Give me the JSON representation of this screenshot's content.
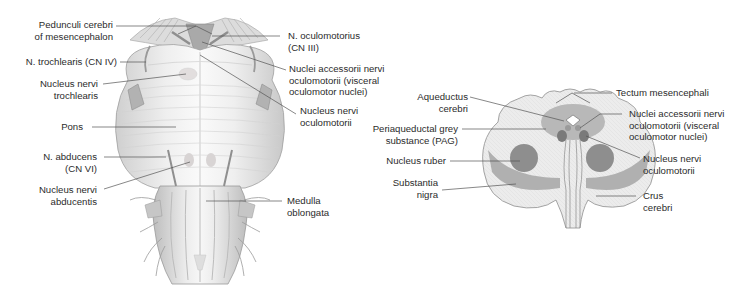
{
  "figure_left": {
    "title": "Brainstem, ventral view",
    "labels": {
      "pedunculi": [
        "Pedunculi cerebri",
        "of mesencephalon"
      ],
      "trochlearis": [
        "N. trochlearis (CN IV)"
      ],
      "nucleus_trochlearis": [
        "Nucleus nervi",
        "trochlearis"
      ],
      "pons": [
        "Pons"
      ],
      "abducens": [
        "N. abducens",
        "(CN VI)"
      ],
      "nucleus_abducentis": [
        "Nucleus nervi",
        "abducentis"
      ],
      "oculomotorius": [
        "N. oculomotorius",
        "(CN III)"
      ],
      "nuclei_accessorii": [
        "Nuclei accessorii nervi",
        "oculomotorii (visceral",
        "oculomotor nuclei)"
      ],
      "nucleus_oculomotorii": [
        "Nucleus nervi",
        "oculomotorii"
      ],
      "medulla": [
        "Medulla",
        "oblongata"
      ]
    }
  },
  "figure_right": {
    "title": "Midbrain cross-section",
    "labels": {
      "aqueductus": [
        "Aqueductus",
        "cerebri"
      ],
      "pag": [
        "Periaqueductal grey",
        "substance (PAG)"
      ],
      "nucleus_ruber": [
        "Nucleus ruber"
      ],
      "substantia_nigra": [
        "Substantia",
        "nigra"
      ],
      "tectum": [
        "Tectum mesencephali"
      ],
      "nuclei_accessorii": [
        "Nuclei accessorii nervi",
        "oculomotorii (visceral",
        "oculomotor nuclei)"
      ],
      "nucleus_oculomotorii": [
        "Nucleus nervi",
        "oculomotorii"
      ],
      "crus": [
        "Crus",
        "cerebri"
      ]
    }
  },
  "colors": {
    "text": "#2b2b2b",
    "leader_line": "#555555",
    "section_fill": "#ececec",
    "section_outline": "#9a9a9a",
    "pag_fill": "#b8b8b8",
    "nucleus_ruber_fill": "#8e8e8e",
    "substantia_nigra_fill": "#b0b0b0",
    "nucleus_dark": "#7a7a7a",
    "brainstem_light": "#f2f2f2",
    "brainstem_mid": "#d6d6d6",
    "brainstem_dark": "#a8a8a8"
  }
}
